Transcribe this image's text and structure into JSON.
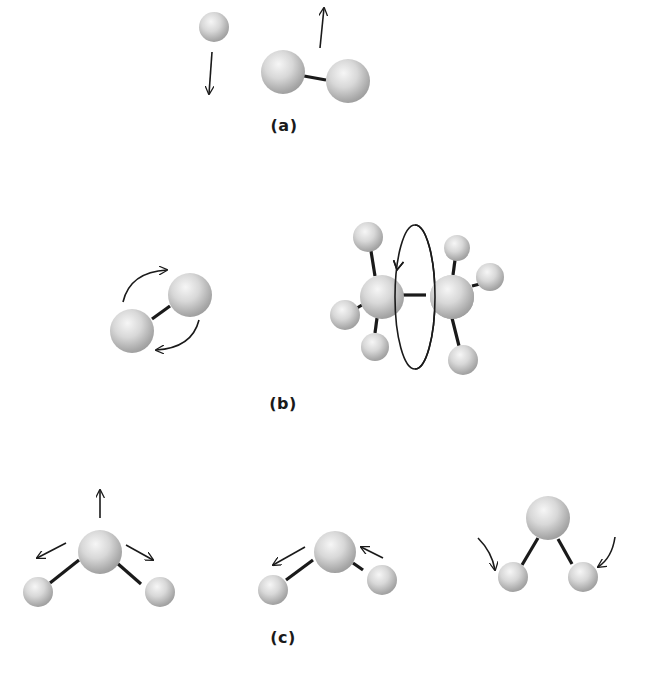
{
  "figure": {
    "panels": [
      {
        "id": "a",
        "label": "(a)",
        "label_pos": [
          284,
          116
        ],
        "description": "translation",
        "atoms": [
          {
            "x": 214,
            "y": 27,
            "r": 15
          },
          {
            "x": 283,
            "y": 72,
            "r": 22
          },
          {
            "x": 348,
            "y": 81,
            "r": 22
          }
        ],
        "bonds": [
          {
            "x1": 304,
            "y1": 76,
            "x2": 326,
            "y2": 80
          }
        ],
        "arrows": [
          {
            "type": "line",
            "x1": 212,
            "y1": 52,
            "x2": 209,
            "y2": 94
          },
          {
            "type": "line",
            "x1": 320,
            "y1": 48,
            "x2": 324,
            "y2": 8
          }
        ]
      },
      {
        "id": "b",
        "label": "(b)",
        "label_pos": [
          283,
          394
        ],
        "description": "rotation",
        "atoms": [
          {
            "x": 190,
            "y": 295,
            "r": 22
          },
          {
            "x": 132,
            "y": 331,
            "r": 22
          },
          {
            "x": 368,
            "y": 237,
            "r": 15
          },
          {
            "x": 457,
            "y": 248,
            "r": 13
          },
          {
            "x": 490,
            "y": 277,
            "r": 14
          },
          {
            "x": 345,
            "y": 315,
            "r": 15
          },
          {
            "x": 375,
            "y": 347,
            "r": 14
          },
          {
            "x": 463,
            "y": 360,
            "r": 15
          },
          {
            "x": 382,
            "y": 297,
            "r": 22
          },
          {
            "x": 452,
            "y": 297,
            "r": 22
          }
        ],
        "bonds": [
          {
            "x1": 152,
            "y1": 319,
            "x2": 170,
            "y2": 306
          },
          {
            "x1": 371,
            "y1": 251,
            "x2": 375,
            "y2": 276
          },
          {
            "x1": 357,
            "y1": 308,
            "x2": 362,
            "y2": 305
          },
          {
            "x1": 377,
            "y1": 318,
            "x2": 375,
            "y2": 333
          },
          {
            "x1": 403,
            "y1": 295,
            "x2": 426,
            "y2": 295
          },
          {
            "x1": 455,
            "y1": 260,
            "x2": 453,
            "y2": 275
          },
          {
            "x1": 472,
            "y1": 286,
            "x2": 484,
            "y2": 283
          },
          {
            "x1": 452,
            "y1": 318,
            "x2": 459,
            "y2": 346
          }
        ],
        "arrows": [
          {
            "type": "path",
            "d": "M 123 302 Q 130 272 167 270",
            "head_at": [
              167,
              270
            ]
          },
          {
            "type": "path",
            "d": "M 199 320 Q 192 348 156 350",
            "head_at": [
              156,
              350
            ]
          },
          {
            "type": "ellipse",
            "cx": 415,
            "cy": 297,
            "rx": 20,
            "ry": 72
          },
          {
            "type": "head",
            "x": 397,
            "y": 270,
            "angle": 100
          }
        ]
      },
      {
        "id": "c",
        "label": "(c)",
        "label_pos": [
          283,
          628
        ],
        "description": "vibration",
        "atoms": [
          {
            "x": 100,
            "y": 552,
            "r": 22
          },
          {
            "x": 38,
            "y": 592,
            "r": 15
          },
          {
            "x": 160,
            "y": 592,
            "r": 15
          },
          {
            "x": 335,
            "y": 552,
            "r": 21
          },
          {
            "x": 273,
            "y": 590,
            "r": 15
          },
          {
            "x": 382,
            "y": 580,
            "r": 15
          },
          {
            "x": 548,
            "y": 518,
            "r": 22
          },
          {
            "x": 513,
            "y": 577,
            "r": 15
          },
          {
            "x": 583,
            "y": 577,
            "r": 15
          }
        ],
        "bonds": [
          {
            "x1": 79,
            "y1": 560,
            "x2": 50,
            "y2": 583
          },
          {
            "x1": 117,
            "y1": 563,
            "x2": 141,
            "y2": 584
          },
          {
            "x1": 313,
            "y1": 560,
            "x2": 286,
            "y2": 580
          },
          {
            "x1": 353,
            "y1": 563,
            "x2": 363,
            "y2": 570
          },
          {
            "x1": 538,
            "y1": 538,
            "x2": 522,
            "y2": 565
          },
          {
            "x1": 558,
            "y1": 539,
            "x2": 572,
            "y2": 564
          }
        ],
        "arrows": [
          {
            "type": "line",
            "x1": 100,
            "y1": 518,
            "x2": 100,
            "y2": 490
          },
          {
            "type": "line",
            "x1": 66,
            "y1": 543,
            "x2": 37,
            "y2": 558
          },
          {
            "type": "line",
            "x1": 126,
            "y1": 545,
            "x2": 153,
            "y2": 560
          },
          {
            "type": "line",
            "x1": 305,
            "y1": 547,
            "x2": 273,
            "y2": 565
          },
          {
            "type": "line",
            "x1": 383,
            "y1": 558,
            "x2": 361,
            "y2": 547
          },
          {
            "type": "path",
            "d": "M 478 538 Q 492 552 495 570",
            "head_at": [
              495,
              570
            ]
          },
          {
            "type": "path",
            "d": "M 615 537 Q 612 558 598 567",
            "head_at": [
              598,
              567
            ]
          }
        ]
      }
    ]
  },
  "colors": {
    "background": "#ffffff",
    "stroke": "#1a1a1a",
    "atom_highlight": "#f4f4f4",
    "atom_mid": "#d0d0d0",
    "atom_shadow": "#9a9a9a"
  }
}
